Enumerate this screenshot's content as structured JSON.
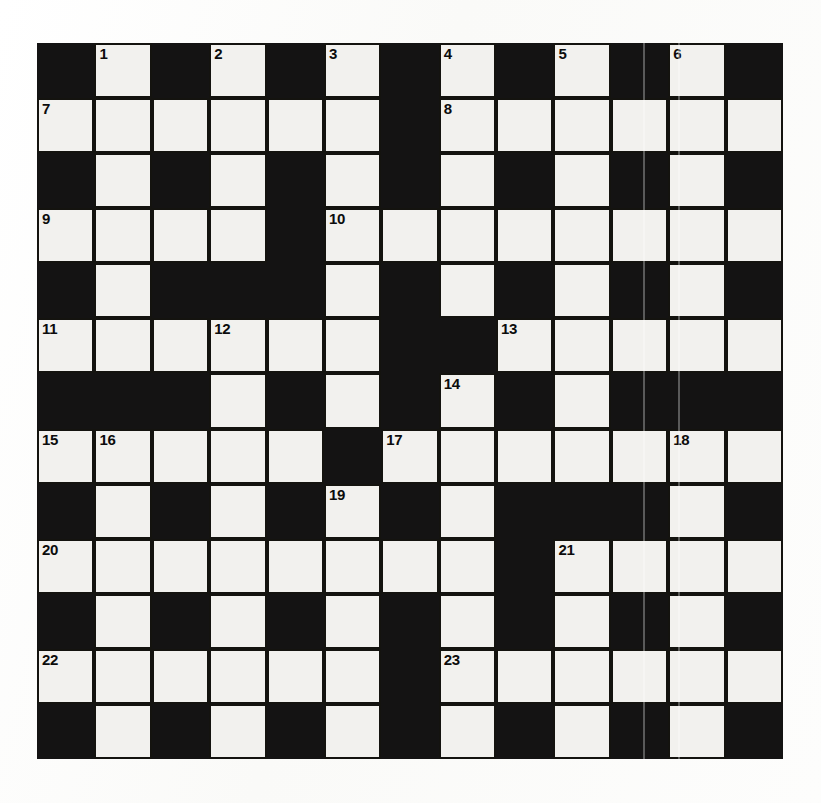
{
  "puzzle": {
    "title": "Crossword Grid",
    "type": "crossword",
    "rows": 13,
    "cols": 13,
    "colors": {
      "block": "#141313",
      "light": "#f2f1ee",
      "number": "#0c0c0c",
      "paper": "#fcfcfb"
    },
    "legend": {
      "block": "#",
      "light": "."
    },
    "grid": [
      "#.#.#.#.#.#.#",
      "......#......",
      "#.#.#.#.#.#.#",
      "....#........",
      "#.###.#.#.#.#",
      "......##.....",
      "###.#.#.#.###",
      ".....#.......",
      "#.#.#.#.###.#",
      "........#....",
      "#.#.#.#.#.#.#",
      "......#......",
      "#.#.#.#.#.#.#"
    ],
    "numbers": [
      {
        "n": "1",
        "row": 0,
        "col": 1
      },
      {
        "n": "2",
        "row": 0,
        "col": 3
      },
      {
        "n": "3",
        "row": 0,
        "col": 5
      },
      {
        "n": "4",
        "row": 0,
        "col": 7
      },
      {
        "n": "5",
        "row": 0,
        "col": 9
      },
      {
        "n": "6",
        "row": 0,
        "col": 11
      },
      {
        "n": "7",
        "row": 1,
        "col": 0
      },
      {
        "n": "8",
        "row": 1,
        "col": 7
      },
      {
        "n": "9",
        "row": 3,
        "col": 0
      },
      {
        "n": "10",
        "row": 3,
        "col": 5
      },
      {
        "n": "11",
        "row": 5,
        "col": 0
      },
      {
        "n": "12",
        "row": 5,
        "col": 3
      },
      {
        "n": "13",
        "row": 5,
        "col": 8
      },
      {
        "n": "14",
        "row": 6,
        "col": 7
      },
      {
        "n": "15",
        "row": 7,
        "col": 0
      },
      {
        "n": "16",
        "row": 7,
        "col": 1
      },
      {
        "n": "17",
        "row": 7,
        "col": 6
      },
      {
        "n": "18",
        "row": 7,
        "col": 11
      },
      {
        "n": "19",
        "row": 8,
        "col": 5
      },
      {
        "n": "20",
        "row": 9,
        "col": 0
      },
      {
        "n": "21",
        "row": 9,
        "col": 9
      },
      {
        "n": "22",
        "row": 11,
        "col": 0
      },
      {
        "n": "23",
        "row": 11,
        "col": 7
      }
    ],
    "streaks": [
      {
        "x": 643
      },
      {
        "x": 678
      }
    ]
  }
}
